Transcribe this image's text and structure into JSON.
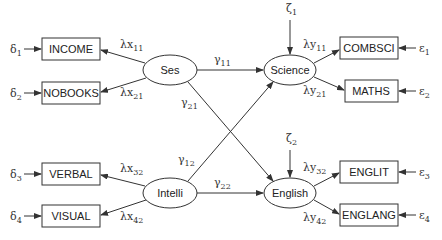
{
  "diagram": {
    "type": "structural-equation-model",
    "observed_exogenous": [
      {
        "id": "INCOME",
        "label": "INCOME",
        "error": "δ",
        "error_sub": "1",
        "loading": "λx",
        "loading_sub": "11"
      },
      {
        "id": "NOBOOKS",
        "label": "NOBOOKS",
        "error": "δ",
        "error_sub": "2",
        "loading": "λx",
        "loading_sub": "21"
      },
      {
        "id": "VERBAL",
        "label": "VERBAL",
        "error": "δ",
        "error_sub": "3",
        "loading": "λx",
        "loading_sub": "32"
      },
      {
        "id": "VISUAL",
        "label": "VISUAL",
        "error": "δ",
        "error_sub": "4",
        "loading": "λx",
        "loading_sub": "42"
      }
    ],
    "observed_endogenous": [
      {
        "id": "COMBSCI",
        "label": "COMBSCI",
        "error": "ε",
        "error_sub": "1",
        "loading": "λy",
        "loading_sub": "11"
      },
      {
        "id": "MATHS",
        "label": "MATHS",
        "error": "ε",
        "error_sub": "2",
        "loading": "λy",
        "loading_sub": "21"
      },
      {
        "id": "ENGLIT",
        "label": "ENGLIT",
        "error": "ε",
        "error_sub": "3",
        "loading": "λy",
        "loading_sub": "32"
      },
      {
        "id": "ENGLANG",
        "label": "ENGLANG",
        "error": "ε",
        "error_sub": "4",
        "loading": "λy",
        "loading_sub": "42"
      }
    ],
    "latent": [
      {
        "id": "Ses",
        "label": "Ses"
      },
      {
        "id": "Intelli",
        "label": "Intelli"
      },
      {
        "id": "Science",
        "label": "Science",
        "disturbance": "ζ",
        "disturbance_sub": "1"
      },
      {
        "id": "English",
        "label": "English",
        "disturbance": "ζ",
        "disturbance_sub": "2"
      }
    ],
    "paths": [
      {
        "from": "Ses",
        "to": "Science",
        "label": "γ",
        "sub": "11"
      },
      {
        "from": "Ses",
        "to": "English",
        "label": "γ",
        "sub": "21"
      },
      {
        "from": "Intelli",
        "to": "Science",
        "label": "γ",
        "sub": "12"
      },
      {
        "from": "Intelli",
        "to": "English",
        "label": "γ",
        "sub": "22"
      }
    ]
  }
}
